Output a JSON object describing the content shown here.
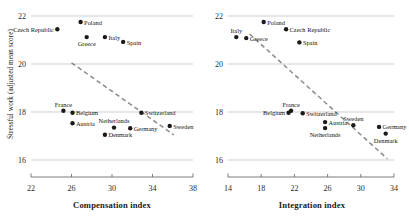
{
  "figure": {
    "background": "#ffffff",
    "point_color": "#1a1a1a",
    "gridline_color": "#b9b9b9",
    "trendline_color": "#8a8a8a",
    "axis_color": "#6e6e6e"
  },
  "chart_data": [
    {
      "type": "scatter",
      "title": "",
      "panel": "left",
      "xlabel": "Compensation index",
      "ylabel": "Stressful work (adjusted mean score)",
      "xlim": [
        22,
        38
      ],
      "ylim": [
        16,
        22
      ],
      "xticks": [
        22,
        26,
        30,
        34,
        38
      ],
      "yticks": [
        16,
        18,
        20,
        22
      ],
      "grid": true,
      "grid_axis": "y",
      "legend": "none",
      "trendline": {
        "style": "dashed",
        "x0": 26.0,
        "y0": 20.05,
        "x1": 36.1,
        "y1": 17.05
      },
      "points": [
        {
          "label": "Czech Republic",
          "x": 24.6,
          "y": 21.45,
          "label_pos": "left"
        },
        {
          "label": "Poland",
          "x": 26.9,
          "y": 21.75,
          "label_pos": "right"
        },
        {
          "label": "Greece",
          "x": 27.5,
          "y": 21.12,
          "label_pos": "below"
        },
        {
          "label": "Italy",
          "x": 29.3,
          "y": 21.12,
          "label_pos": "right"
        },
        {
          "label": "Spain",
          "x": 31.1,
          "y": 20.92,
          "label_pos": "right"
        },
        {
          "label": "France",
          "x": 25.2,
          "y": 18.05,
          "label_pos": "above"
        },
        {
          "label": "Belgium",
          "x": 26.1,
          "y": 17.97,
          "label_pos": "right"
        },
        {
          "label": "Switzerland",
          "x": 32.9,
          "y": 17.97,
          "label_pos": "right"
        },
        {
          "label": "Austria",
          "x": 26.1,
          "y": 17.53,
          "label_pos": "right"
        },
        {
          "label": "Netherlands",
          "x": 30.2,
          "y": 17.35,
          "label_pos": "above"
        },
        {
          "label": "Germany",
          "x": 31.8,
          "y": 17.32,
          "label_pos": "right"
        },
        {
          "label": "Sweden",
          "x": 35.7,
          "y": 17.42,
          "label_pos": "right"
        },
        {
          "label": "Denmark",
          "x": 29.3,
          "y": 17.05,
          "label_pos": "right"
        }
      ]
    },
    {
      "type": "scatter",
      "title": "",
      "panel": "right",
      "xlabel": "Integration index",
      "ylabel": "",
      "xlim": [
        14,
        34
      ],
      "ylim": [
        16,
        22
      ],
      "xticks": [
        14,
        18,
        22,
        26,
        30,
        34
      ],
      "yticks": [
        16,
        18,
        20,
        22
      ],
      "grid": true,
      "grid_axis": "y",
      "legend": "none",
      "trendline": {
        "style": "dashed",
        "x0": 16.6,
        "y0": 21.25,
        "x1": 33.2,
        "y1": 16.05
      },
      "points": [
        {
          "label": "Poland",
          "x": 18.3,
          "y": 21.75,
          "label_pos": "right"
        },
        {
          "label": "Czech Republic",
          "x": 21.0,
          "y": 21.45,
          "label_pos": "right"
        },
        {
          "label": "Italy",
          "x": 15.0,
          "y": 21.12,
          "label_pos": "above"
        },
        {
          "label": "Greece",
          "x": 16.2,
          "y": 21.08,
          "label_pos": "right"
        },
        {
          "label": "Spain",
          "x": 22.6,
          "y": 20.9,
          "label_pos": "right"
        },
        {
          "label": "France",
          "x": 21.6,
          "y": 18.05,
          "label_pos": "above"
        },
        {
          "label": "Belgium",
          "x": 21.3,
          "y": 17.97,
          "label_pos": "left"
        },
        {
          "label": "Switzerland",
          "x": 23.0,
          "y": 17.95,
          "label_pos": "right"
        },
        {
          "label": "Austria",
          "x": 25.7,
          "y": 17.58,
          "label_pos": "right"
        },
        {
          "label": "Netherlands",
          "x": 25.7,
          "y": 17.33,
          "label_pos": "below"
        },
        {
          "label": "Sweden",
          "x": 29.1,
          "y": 17.45,
          "label_pos": "above"
        },
        {
          "label": "Germany",
          "x": 32.2,
          "y": 17.38,
          "label_pos": "right"
        },
        {
          "label": "Denmark",
          "x": 33.0,
          "y": 17.1,
          "label_pos": "below"
        }
      ]
    }
  ]
}
